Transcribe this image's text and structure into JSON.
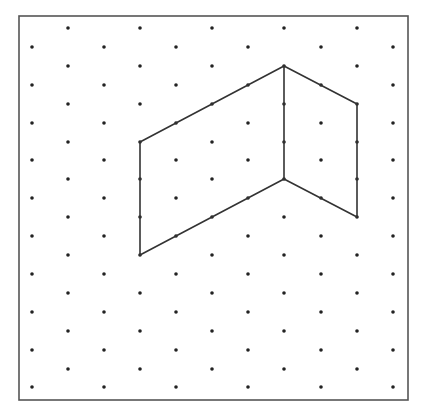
{
  "diagram": {
    "type": "isometric-dot-grid",
    "background": "#ffffff",
    "border": {
      "x1": 19,
      "y1": 16,
      "x2": 408,
      "y2": 400,
      "color": "#555555",
      "width": 1.6
    },
    "dot_color": "#222222",
    "dot_radius": 1.8,
    "line_color": "#333333",
    "line_width": 1.6,
    "grid": {
      "columns_x": [
        32,
        68,
        104,
        140,
        176,
        212,
        248,
        284,
        321,
        357,
        393
      ],
      "even_rows_y": [
        47,
        85,
        123,
        160,
        198,
        236,
        274,
        312,
        350,
        387
      ],
      "odd_rows_y": [
        28,
        66,
        104,
        142,
        179,
        217,
        255,
        293,
        331,
        369
      ]
    },
    "shape": {
      "outline": [
        [
          140,
          142
        ],
        [
          284,
          66
        ],
        [
          357,
          104
        ],
        [
          357,
          217
        ],
        [
          284,
          179
        ],
        [
          140,
          255
        ]
      ],
      "inner_edges": [
        [
          [
            284,
            66
          ],
          [
            284,
            179
          ]
        ]
      ],
      "description": "Two adjoining parallelogram faces of an isometric shape: a left face spanning 4 units along the isometric axis and 3 units tall, and a right face spanning 2 units and 3 units tall, sharing a vertical edge."
    }
  }
}
